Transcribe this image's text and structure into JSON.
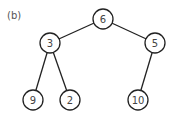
{
  "figure": {
    "label": "(b)",
    "type": "binary-tree",
    "nodes": [
      {
        "id": "n6",
        "value": "6",
        "x": 103,
        "y": 19
      },
      {
        "id": "n3",
        "value": "3",
        "x": 50,
        "y": 43
      },
      {
        "id": "n5",
        "value": "5",
        "x": 155,
        "y": 43
      },
      {
        "id": "n9",
        "value": "9",
        "x": 33,
        "y": 100
      },
      {
        "id": "n2",
        "value": "2",
        "x": 70,
        "y": 100
      },
      {
        "id": "n10",
        "value": "10",
        "x": 138,
        "y": 100
      }
    ],
    "edges": [
      {
        "from": "6",
        "to": "3"
      },
      {
        "from": "6",
        "to": "5"
      },
      {
        "from": "3",
        "to": "9"
      },
      {
        "from": "3",
        "to": "2"
      },
      {
        "from": "5",
        "to": "10"
      }
    ]
  }
}
